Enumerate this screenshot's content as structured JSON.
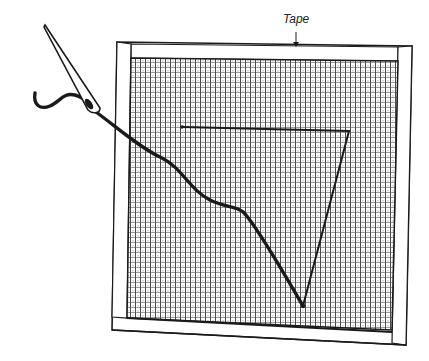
{
  "figure": {
    "labels": {
      "tape": "Tape"
    },
    "colors": {
      "ink": "#1a1a1a",
      "paper": "#ffffff",
      "mesh": "#444444"
    }
  }
}
